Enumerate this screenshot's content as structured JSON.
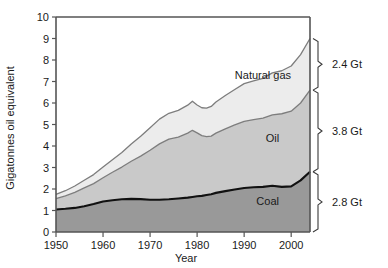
{
  "chart_data": {
    "type": "area",
    "stacked": true,
    "title": "",
    "subtitle": "",
    "xlabel": "Year",
    "ylabel": "Gigatonnes oil equivalent",
    "xlim": [
      1950,
      2004
    ],
    "ylim": [
      0,
      10
    ],
    "grid": false,
    "legend_position": "inline-annotations",
    "x_ticks": [
      1950,
      1960,
      1970,
      1980,
      1990,
      2000
    ],
    "x_tick_labels": [
      "1950",
      "1960",
      "1970",
      "1980",
      "1990",
      "2000"
    ],
    "y_ticks": [
      0,
      1,
      2,
      3,
      4,
      5,
      6,
      7,
      8,
      9,
      10
    ],
    "y_tick_labels": [
      "0",
      "1",
      "2",
      "3",
      "4",
      "5",
      "6",
      "7",
      "8",
      "9",
      "10"
    ],
    "x": [
      1950,
      1952,
      1954,
      1956,
      1958,
      1960,
      1962,
      1964,
      1966,
      1968,
      1970,
      1972,
      1974,
      1976,
      1978,
      1979,
      1980,
      1981,
      1982,
      1983,
      1984,
      1986,
      1988,
      1990,
      1992,
      1994,
      1996,
      1998,
      2000,
      2002,
      2004
    ],
    "series": [
      {
        "name": "Coal",
        "color": "#999999",
        "values": [
          1.05,
          1.08,
          1.12,
          1.2,
          1.3,
          1.42,
          1.48,
          1.52,
          1.54,
          1.53,
          1.5,
          1.5,
          1.52,
          1.56,
          1.6,
          1.63,
          1.66,
          1.68,
          1.72,
          1.76,
          1.82,
          1.9,
          1.98,
          2.05,
          2.08,
          2.1,
          2.15,
          2.1,
          2.12,
          2.4,
          2.8
        ]
      },
      {
        "name": "Oil",
        "color": "#c9c9c9",
        "values": [
          0.5,
          0.6,
          0.72,
          0.85,
          0.95,
          1.1,
          1.3,
          1.5,
          1.75,
          2.0,
          2.3,
          2.6,
          2.8,
          2.85,
          3.0,
          3.1,
          2.95,
          2.8,
          2.72,
          2.7,
          2.78,
          2.9,
          3.0,
          3.1,
          3.15,
          3.2,
          3.3,
          3.4,
          3.5,
          3.6,
          3.8
        ]
      },
      {
        "name": "Natural gas",
        "color": "#ececec",
        "values": [
          0.2,
          0.24,
          0.3,
          0.36,
          0.42,
          0.5,
          0.58,
          0.68,
          0.8,
          0.92,
          1.05,
          1.15,
          1.2,
          1.25,
          1.3,
          1.35,
          1.3,
          1.3,
          1.32,
          1.38,
          1.45,
          1.55,
          1.65,
          1.75,
          1.8,
          1.85,
          1.95,
          2.0,
          2.1,
          2.25,
          2.4
        ]
      }
    ],
    "annotations": [
      {
        "text": "Natural gas",
        "x": 1994,
        "y": 7.1
      },
      {
        "text": "Oil",
        "x": 1996,
        "y": 4.2
      },
      {
        "text": "Coal",
        "x": 1995,
        "y": 1.25
      }
    ],
    "end_brackets": [
      {
        "label": "2.4 Gt",
        "series": "Natural gas",
        "value": 2.4
      },
      {
        "label": "3.8 Gt",
        "series": "Oil",
        "value": 3.8
      },
      {
        "label": "2.8 Gt",
        "series": "Coal",
        "value": 2.8
      }
    ]
  }
}
